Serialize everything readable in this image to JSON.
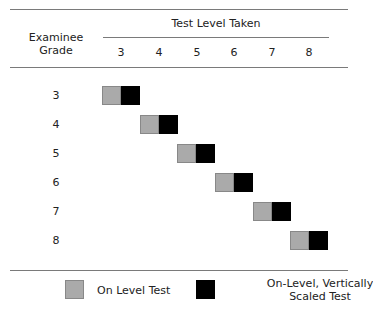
{
  "header": {
    "row_label_line1": "Examinee",
    "row_label_line2": "Grade",
    "column_group_label": "Test Level Taken",
    "columns": [
      "3",
      "4",
      "5",
      "6",
      "7",
      "8"
    ]
  },
  "rows": [
    {
      "grade": "3",
      "test_level": "3"
    },
    {
      "grade": "4",
      "test_level": "4"
    },
    {
      "grade": "5",
      "test_level": "5"
    },
    {
      "grade": "6",
      "test_level": "6"
    },
    {
      "grade": "7",
      "test_level": "7"
    },
    {
      "grade": "8",
      "test_level": "8"
    }
  ],
  "legend": {
    "items": [
      {
        "label": "On Level Test",
        "color": "#aaaaaa"
      },
      {
        "label_line1": "On-Level, Vertically",
        "label_line2": "Scaled Test",
        "color": "#000000"
      }
    ]
  },
  "colors": {
    "on_level": "#aaaaaa",
    "vertically_scaled": "#000000",
    "rule": "#7a7a7a"
  }
}
